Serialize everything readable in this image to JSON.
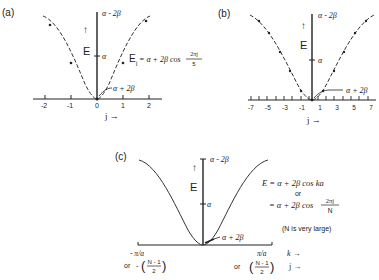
{
  "panels": {
    "a": {
      "label": "(a)",
      "top_label": "α - 2β",
      "mid_label": "α",
      "bottom_label": "α + 2β",
      "energy_axis": "E",
      "up_arrow": "↑",
      "equation_lhs": "E",
      "equation_sub": "j",
      "equation_rhs": " = α + 2β cos",
      "frac_num": "2πj",
      "frac_den": "5",
      "x_axis_label": "j →",
      "ticks": [
        "-2",
        "-1",
        "0",
        "1",
        "2"
      ]
    },
    "b": {
      "label": "(b)",
      "top_label": "α - 2β",
      "mid_label": "α",
      "bottom_label": "α + 2β",
      "energy_axis": "E",
      "up_arrow": "↑",
      "x_axis_label": "j →",
      "ticks": [
        "-7",
        "-5",
        "-3",
        "-1",
        "1",
        "3",
        "5",
        "7"
      ]
    },
    "c": {
      "label": "(c)",
      "top_label": "α - 2β",
      "mid_label": "α",
      "bottom_label": "α + 2β",
      "energy_axis": "E",
      "up_arrow": "↑",
      "eq1": "E = α + 2β cos ka",
      "or1": "or",
      "eq2_prefix": "= α + 2β cos",
      "eq2_num": "2πj",
      "eq2_den": "N",
      "note": "(N is very large)",
      "left_k": "- π/a",
      "left_or": "or",
      "left_minus": "-",
      "left_num": "N - 1",
      "left_den": "2",
      "right_k": "π/a",
      "right_or": "or",
      "right_num": "N - 1",
      "right_den": "2",
      "k_label": "k →",
      "j_label": "j →"
    }
  },
  "colors": {
    "ink": "#222222",
    "background": "#ffffff"
  }
}
